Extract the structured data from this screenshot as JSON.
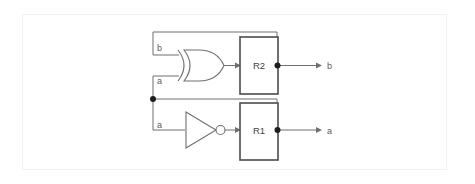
{
  "diagram": {
    "type": "digital-logic-schematic",
    "colors": {
      "wire": "#6f6f73",
      "register_border": "#4c4c50",
      "junction_dot": "#1d1d20",
      "frame_border": "#f2f2f3",
      "background": "#ffffff",
      "label_text": "#5c5c60"
    },
    "frame": {
      "x": 22,
      "y": 14,
      "width": 425,
      "height": 156
    },
    "rows": [
      {
        "id": "row-top",
        "gate": {
          "name": "xor-gate",
          "type": "XOR",
          "symbol": "⊕",
          "inputs": [
            {
              "id": "xor-input-b",
              "label": "b",
              "source": "feedback-from-r2"
            },
            {
              "id": "xor-input-a",
              "label": "a",
              "source": "node-a"
            }
          ]
        },
        "register": {
          "id": "register-r2",
          "label": "R2"
        },
        "output": {
          "id": "output-b",
          "label": "b"
        },
        "feedback": {
          "id": "feedback-wire-b",
          "from": "register-r2",
          "to": "xor-input-b"
        }
      },
      {
        "id": "row-bottom",
        "gate": {
          "name": "not-gate",
          "type": "NOT",
          "symbol": "¬",
          "inputs": [
            {
              "id": "not-input-a",
              "label": "a",
              "source": "feedback-from-r1"
            }
          ]
        },
        "register": {
          "id": "register-r1",
          "label": "R1"
        },
        "output": {
          "id": "output-a",
          "label": "a"
        },
        "feedback": {
          "id": "feedback-wire-a",
          "from": "register-r1",
          "to": "node-a"
        }
      }
    ],
    "labels": {
      "xor_in_top": "b",
      "xor_in_bottom": "a",
      "not_in": "a",
      "reg_top": "R2",
      "reg_bottom": "R1",
      "out_top": "b",
      "out_bottom": "a"
    }
  }
}
